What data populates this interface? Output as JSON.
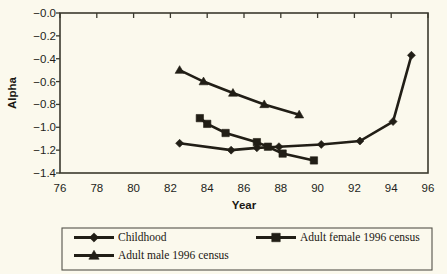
{
  "chart_data": {
    "type": "line",
    "title": "",
    "xlabel": "Year",
    "ylabel": "Alpha",
    "xlim": [
      76,
      96
    ],
    "ylim": [
      -1.4,
      0.0
    ],
    "xticks": [
      "76",
      "78",
      "80",
      "82",
      "84",
      "86",
      "88",
      "90",
      "92",
      "94",
      "96"
    ],
    "yticks": [
      "-0.0",
      "-0.2",
      "-0.4",
      "-0.6",
      "-0.8",
      "-1.0",
      "-1.2",
      "-1.4"
    ],
    "grid": false,
    "legend_position": "bottom",
    "series": [
      {
        "name": "Childhood",
        "marker": "diamond",
        "x": [
          82.5,
          85.3,
          86.7,
          87.9,
          90.2,
          92.3,
          94.1,
          95.1
        ],
        "y": [
          -1.14,
          -1.2,
          -1.18,
          -1.17,
          -1.15,
          -1.12,
          -0.95,
          -0.37
        ]
      },
      {
        "name": "Adult female 1996 census",
        "marker": "square",
        "x": [
          83.6,
          84.0,
          85.0,
          86.7,
          87.3,
          88.1,
          89.8
        ],
        "y": [
          -0.92,
          -0.97,
          -1.05,
          -1.13,
          -1.17,
          -1.23,
          -1.29
        ]
      },
      {
        "name": "Adult male 1996 census",
        "marker": "triangle",
        "x": [
          82.5,
          83.8,
          85.4,
          87.1,
          89.0
        ],
        "y": [
          -0.5,
          -0.6,
          -0.7,
          -0.8,
          -0.89
        ]
      }
    ]
  },
  "axes": {
    "x_title": "Year",
    "y_title": "Alpha",
    "x_tick_labels": [
      "76",
      "78",
      "80",
      "82",
      "84",
      "86",
      "88",
      "90",
      "92",
      "94",
      "96"
    ],
    "y_tick_labels": [
      "-0.0",
      "-0.2",
      "-0.4",
      "-0.6",
      "-0.8",
      "-1.0",
      "-1.2",
      "-1.4"
    ]
  },
  "legend": {
    "entries": [
      {
        "label": "Childhood",
        "marker": "diamond"
      },
      {
        "label": "Adult female 1996 census",
        "marker": "square"
      },
      {
        "label": "Adult male 1996 census",
        "marker": "triangle"
      }
    ]
  },
  "colors": {
    "background": "#fbf9ed",
    "ink": "#211e16",
    "frame": "#3b3a2e"
  }
}
